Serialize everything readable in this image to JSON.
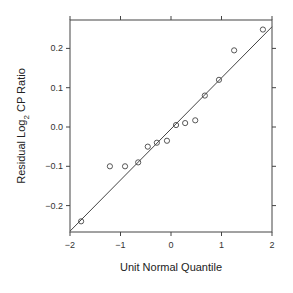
{
  "chart_data": {
    "type": "scatter",
    "title": "",
    "xlabel": "Unit Normal Quantile",
    "ylabel": "Residual Log2 CP Ratio",
    "ylabel_parts": {
      "main": "Residual Log",
      "sub": "2",
      "rest": " CP Ratio"
    },
    "xlim": [
      -2,
      2
    ],
    "ylim": [
      -0.27,
      0.27
    ],
    "x_ticks": [
      -2,
      -1,
      0,
      1,
      2
    ],
    "x_tick_labels": [
      "−2",
      "−1",
      "0",
      "1",
      "2"
    ],
    "y_ticks": [
      -0.2,
      -0.1,
      0.0,
      0.1,
      0.2
    ],
    "y_tick_labels": [
      "−0.2",
      "−0.1",
      "0.0",
      "0.1",
      "0.2"
    ],
    "grid": false,
    "legend": null,
    "points": [
      {
        "x": -1.78,
        "y": -0.24
      },
      {
        "x": -1.21,
        "y": -0.1
      },
      {
        "x": -0.91,
        "y": -0.1
      },
      {
        "x": -0.65,
        "y": -0.09
      },
      {
        "x": -0.46,
        "y": -0.05
      },
      {
        "x": -0.28,
        "y": -0.04
      },
      {
        "x": -0.08,
        "y": -0.035
      },
      {
        "x": 0.1,
        "y": 0.005
      },
      {
        "x": 0.28,
        "y": 0.01
      },
      {
        "x": 0.48,
        "y": 0.017
      },
      {
        "x": 0.67,
        "y": 0.08
      },
      {
        "x": 0.95,
        "y": 0.12
      },
      {
        "x": 1.25,
        "y": 0.195
      },
      {
        "x": 1.82,
        "y": 0.248
      }
    ],
    "fit_line": {
      "x": [
        -2,
        2
      ],
      "y": [
        -0.265,
        0.255
      ]
    }
  }
}
